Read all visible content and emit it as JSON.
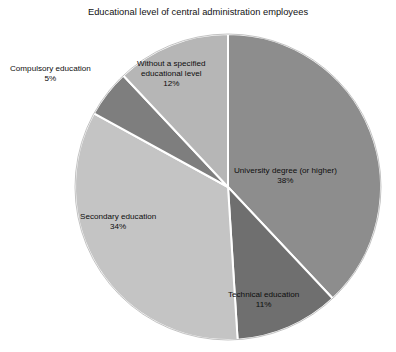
{
  "chart_data": {
    "type": "pie",
    "title": "Educational level of central administration employees",
    "xlabel": "",
    "ylabel": "",
    "legend_position": "none",
    "grid": false,
    "start_angle_deg": 0,
    "direction": "clockwise",
    "categories": [
      "University degree (or higher)",
      "Technical education",
      "Secondary education",
      "Compulsory education",
      "Without a specified educational level"
    ],
    "values": [
      38,
      11,
      34,
      5,
      12
    ],
    "value_labels": [
      "38%",
      "11%",
      "34%",
      "5%",
      "12%"
    ],
    "colors": [
      "#8d8d8d",
      "#6f6f6f",
      "#c4c4c4",
      "#7e7e7e",
      "#b6b6b6"
    ],
    "total": 100,
    "units": "percent",
    "slices": [
      {
        "name": "University degree (or higher)",
        "label_line1": "University degree (or higher)",
        "label_line2": "",
        "percent_label": "38%",
        "value": 38,
        "color": "#8d8d8d",
        "label_placement": "inside"
      },
      {
        "name": "Technical education",
        "label_line1": "Technical education",
        "label_line2": "",
        "percent_label": "11%",
        "value": 11,
        "color": "#6f6f6f",
        "label_placement": "inside"
      },
      {
        "name": "Secondary education",
        "label_line1": "Secondary education",
        "label_line2": "",
        "percent_label": "34%",
        "value": 34,
        "color": "#c4c4c4",
        "label_placement": "inside"
      },
      {
        "name": "Compulsory education",
        "label_line1": "Compulsory education",
        "label_line2": "",
        "percent_label": "5%",
        "value": 5,
        "color": "#7e7e7e",
        "label_placement": "outside"
      },
      {
        "name": "Without a specified educational level",
        "label_line1": "Without a specified",
        "label_line2": "educational level",
        "percent_label": "12%",
        "value": 12,
        "color": "#b6b6b6",
        "label_placement": "inside"
      }
    ],
    "style": {
      "background": "#ffffff",
      "slice_border_color": "#ffffff",
      "slice_border_width": 2,
      "text_color": "#0d0d0d"
    }
  }
}
